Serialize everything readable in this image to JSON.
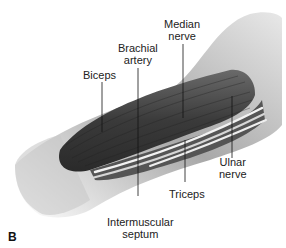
{
  "figure": {
    "panel_letter": "B"
  },
  "labels": {
    "biceps": "Biceps",
    "brachial_artery_line1": "Brachial",
    "brachial_artery_line2": "artery",
    "median_nerve_line1": "Median",
    "median_nerve_line2": "nerve",
    "ulnar_nerve_line1": "Ulnar",
    "ulnar_nerve_line2": "nerve",
    "triceps": "Triceps",
    "intermuscular_septum_line1": "Intermuscular",
    "intermuscular_septum_line2": "septum"
  },
  "colors": {
    "muscle": "#3a3a3a",
    "skin": "#d8d8d8",
    "nerve": "#f0f0f0",
    "leader_line": "#111111"
  }
}
